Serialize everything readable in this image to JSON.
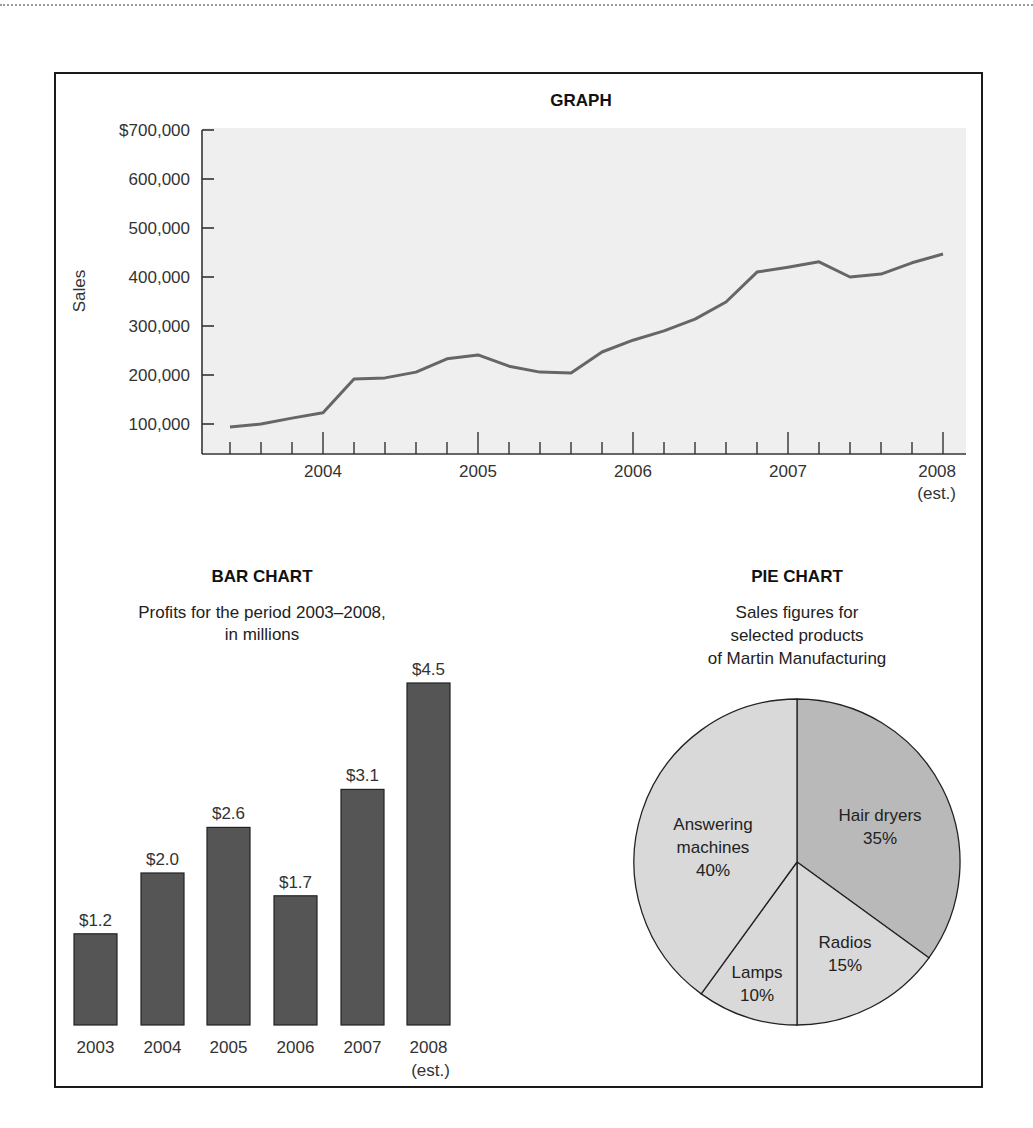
{
  "graph": {
    "title": "GRAPH",
    "ylabel": "Sales",
    "y_ticks": [
      "$700,000",
      "600,000",
      "500,000",
      "400,000",
      "300,000",
      "200,000",
      "100,000"
    ],
    "x_labels": [
      "2004",
      "2005",
      "2006",
      "2007",
      "2008"
    ],
    "x_note": "(est.)"
  },
  "bar_chart": {
    "title": "BAR CHART",
    "subtitle_line1": "Profits for the period 2003–2008,",
    "subtitle_line2": "in millions",
    "bars": [
      {
        "year": "2003",
        "label": "$1.2"
      },
      {
        "year": "2004",
        "label": "$2.0"
      },
      {
        "year": "2005",
        "label": "$2.6"
      },
      {
        "year": "2006",
        "label": "$1.7"
      },
      {
        "year": "2007",
        "label": "$3.1"
      },
      {
        "year": "2008",
        "label": "$4.5"
      }
    ],
    "last_note": "(est.)"
  },
  "pie_chart": {
    "title": "PIE CHART",
    "subtitle_line1": "Sales figures for",
    "subtitle_line2": "selected products",
    "subtitle_line3": "of Martin Manufacturing",
    "slices": [
      {
        "name_line1": "Hair dryers",
        "name_line2": "",
        "pct": "35%"
      },
      {
        "name_line1": "Radios",
        "name_line2": "",
        "pct": "15%"
      },
      {
        "name_line1": "Lamps",
        "name_line2": "",
        "pct": "10%"
      },
      {
        "name_line1": "Answering",
        "name_line2": "machines",
        "pct": "40%"
      }
    ]
  },
  "colors": {
    "plot_bg": "#efefef",
    "line": "#666666",
    "bar_fill": "#555555",
    "pie_dark": "#b9b9b9",
    "pie_light": "#d9d9d9"
  },
  "chart_data": [
    {
      "type": "line",
      "title": "GRAPH",
      "xlabel": "",
      "ylabel": "Sales",
      "ylim": [
        40000,
        700000
      ],
      "y_ticks": [
        100000,
        200000,
        300000,
        400000,
        500000,
        600000,
        700000
      ],
      "x_tick_labels": [
        "2004",
        "2005",
        "2006",
        "2007",
        "2008 (est.)"
      ],
      "grid": false,
      "x": [
        2003.4,
        2003.6,
        2003.8,
        2004.0,
        2004.2,
        2004.4,
        2004.6,
        2004.8,
        2005.0,
        2005.2,
        2005.4,
        2005.6,
        2005.8,
        2006.0,
        2006.2,
        2006.4,
        2006.6,
        2006.8,
        2007.0,
        2007.2,
        2007.4,
        2007.6,
        2007.8,
        2008.0
      ],
      "values": [
        94000,
        100000,
        112000,
        123000,
        192000,
        194000,
        206000,
        233000,
        241000,
        218000,
        206000,
        204000,
        247000,
        271000,
        290000,
        314000,
        349000,
        410000,
        420000,
        431000,
        400000,
        406000,
        429000,
        447000
      ]
    },
    {
      "type": "bar",
      "title": "BAR CHART",
      "subtitle": "Profits for the period 2003–2008, in millions",
      "categories": [
        "2003",
        "2004",
        "2005",
        "2006",
        "2007",
        "2008 (est.)"
      ],
      "values": [
        1.2,
        2.0,
        2.6,
        1.7,
        3.1,
        4.5
      ],
      "xlabel": "",
      "ylabel": "",
      "value_labels": [
        "$1.2",
        "$2.0",
        "$2.6",
        "$1.7",
        "$3.1",
        "$4.5"
      ]
    },
    {
      "type": "pie",
      "title": "PIE CHART",
      "subtitle": "Sales figures for selected products of Martin Manufacturing",
      "categories": [
        "Hair dryers",
        "Radios",
        "Lamps",
        "Answering machines"
      ],
      "values": [
        35,
        15,
        10,
        40
      ]
    }
  ]
}
